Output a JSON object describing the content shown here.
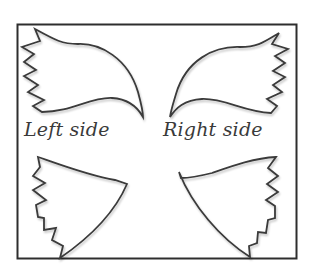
{
  "diagram": {
    "labels": {
      "left": "Left side",
      "right": "Right side"
    },
    "shapes": [
      {
        "name": "upper-left-wing",
        "side": "left"
      },
      {
        "name": "upper-right-wing",
        "side": "right"
      },
      {
        "name": "lower-left-wing",
        "side": "left"
      },
      {
        "name": "lower-right-wing",
        "side": "right"
      }
    ],
    "colors": {
      "stroke": "#3a3a3a",
      "frame": "#2e2e2e",
      "background": "#ffffff"
    }
  }
}
